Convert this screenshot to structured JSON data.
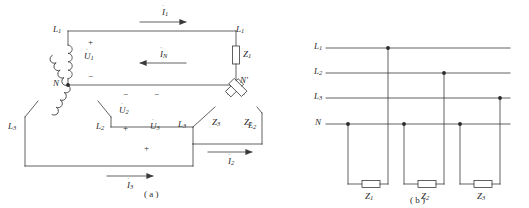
{
  "figure": {
    "kind": "electrical-schematic",
    "stroke_color": "#3a3a3a",
    "text_color": "#2a2a2a",
    "background_color": "#ffffff"
  },
  "diagram_a": {
    "caption": "( a )",
    "source_terminals": {
      "line1_left": "L",
      "line1_left_sub": "1",
      "line3_left": "L",
      "line3_left_sub": "3",
      "line2_mid": "L",
      "line2_mid_sub": "2",
      "neutral": "N"
    },
    "load_terminals": {
      "line1_right": "L",
      "line1_right_sub": "1",
      "line3_right": "L",
      "line3_right_sub": "3",
      "line2_right": "L",
      "line2_right_sub": "2",
      "neutral_prime": "N'"
    },
    "voltages": [
      {
        "name": "U",
        "sub": "1",
        "dot": "˙",
        "plus": "+",
        "minus": "−"
      },
      {
        "name": "U",
        "sub": "2",
        "dot": "˙",
        "plus": "+",
        "minus": "−"
      },
      {
        "name": "U",
        "sub": "3",
        "dot": "˙",
        "plus": "+",
        "minus": "−"
      }
    ],
    "currents": [
      {
        "name": "I",
        "sub": "1",
        "dot": "˙",
        "direction": "right"
      },
      {
        "name": "I",
        "sub": "2",
        "dot": "˙",
        "direction": "right"
      },
      {
        "name": "I",
        "sub": "3",
        "dot": "˙",
        "direction": "right"
      },
      {
        "name": "I",
        "sub": "N",
        "dot": "˙",
        "direction": "left"
      }
    ],
    "impedances": [
      {
        "name": "Z",
        "sub": "1",
        "orientation": "vertical"
      },
      {
        "name": "Z",
        "sub": "2",
        "orientation": "tilted-right"
      },
      {
        "name": "Z",
        "sub": "3",
        "orientation": "tilted-left"
      }
    ]
  },
  "diagram_b": {
    "caption": "( b )",
    "bus_labels": [
      {
        "name": "L",
        "sub": "1"
      },
      {
        "name": "L",
        "sub": "2"
      },
      {
        "name": "L",
        "sub": "3"
      },
      {
        "name": "N",
        "sub": ""
      }
    ],
    "impedances": [
      {
        "name": "Z",
        "sub": "1"
      },
      {
        "name": "Z",
        "sub": "2"
      },
      {
        "name": "Z",
        "sub": "3"
      }
    ]
  }
}
